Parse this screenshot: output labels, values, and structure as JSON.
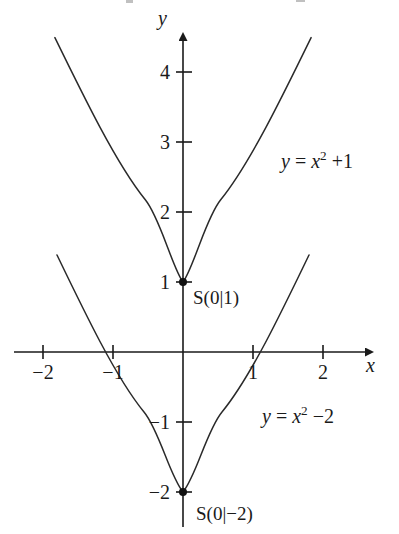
{
  "figure": {
    "type": "coordinate-plane",
    "background_color": "#ffffff",
    "stroke_color": "#1a1a1a",
    "width": 399,
    "height": 534
  },
  "axes": {
    "x_axis_name": "x",
    "y_axis_name": "y",
    "origin_px": [
      183,
      352
    ],
    "pixels_per_unit": 70,
    "x_ticks": [
      {
        "value": -2,
        "label": "−2",
        "px": 43
      },
      {
        "value": -1,
        "label": "−1",
        "px": 113
      },
      {
        "value": 1,
        "label": "1",
        "px": 253
      },
      {
        "value": 2,
        "label": "2",
        "px": 323
      }
    ],
    "y_ticks": [
      {
        "value": 4,
        "label": "4",
        "px": 72
      },
      {
        "value": 3,
        "label": "3",
        "px": 142
      },
      {
        "value": 2,
        "label": "2",
        "px": 212
      },
      {
        "value": 1,
        "label": "1",
        "px": 282
      },
      {
        "value": -1,
        "label": "−1",
        "px": 422
      },
      {
        "value": -2,
        "label": "−2",
        "px": 492
      }
    ]
  },
  "curves": [
    {
      "id": "parabola-upper",
      "label_html": "y = x<sup>2</sup> +1",
      "label_plain": "y = x² + 1",
      "a": 1,
      "c": 1,
      "x_from": -1.83,
      "x_to": 1.83,
      "vertex": {
        "x": 0,
        "y": 1
      },
      "vertex_label": "S(0|1)"
    },
    {
      "id": "parabola-lower",
      "label_html": "y = x<sup>2</sup> −2",
      "label_plain": "y = x² − 2",
      "a": 1,
      "c": -2,
      "x_from": -1.8,
      "x_to": 1.8,
      "vertex": {
        "x": 0,
        "y": -2
      },
      "vertex_label": "S(0|−2)",
      "roots": [
        -1.414,
        1.414
      ]
    }
  ],
  "labels": {
    "equation_upper_px": [
      281,
      151
    ],
    "equation_lower_px": [
      262,
      406
    ],
    "vertex_upper_px": [
      193,
      280
    ],
    "vertex_lower_px": [
      196,
      500
    ],
    "x_name_px": [
      369,
      363
    ],
    "y_name_px": [
      160,
      18
    ]
  },
  "chart_data": {
    "type": "line",
    "title": "",
    "subtitle": "",
    "xlabel": "x",
    "ylabel": "y",
    "xlim": [
      -2.4,
      2.75
    ],
    "ylim": [
      -2.6,
      4.8
    ],
    "xticks": [
      -2,
      -1,
      1,
      2
    ],
    "yticks": [
      4,
      3,
      2,
      1,
      -1,
      -2
    ],
    "grid": false,
    "legend_position": "inline-annotation",
    "series": [
      {
        "name": "y = x² + 1",
        "equation": "y = x^2 + 1",
        "vertex": [
          0,
          1
        ],
        "vertex_label": "S(0|1)",
        "x": [
          -1.83,
          -1.6,
          -1.4,
          -1.2,
          -1.0,
          -0.8,
          -0.6,
          -0.4,
          -0.2,
          0,
          0.2,
          0.4,
          0.6,
          0.8,
          1.0,
          1.2,
          1.4,
          1.6,
          1.83
        ],
        "values": [
          4.35,
          3.56,
          2.96,
          2.44,
          2.0,
          1.64,
          1.36,
          1.16,
          1.04,
          1.0,
          1.04,
          1.16,
          1.36,
          1.64,
          2.0,
          2.44,
          2.96,
          3.56,
          4.35
        ]
      },
      {
        "name": "y = x² − 2",
        "equation": "y = x^2 - 2",
        "vertex": [
          0,
          -2
        ],
        "vertex_label": "S(0|−2)",
        "roots": [
          -1.414,
          1.414
        ],
        "x": [
          -1.8,
          -1.6,
          -1.4,
          -1.2,
          -1.0,
          -0.8,
          -0.6,
          -0.4,
          -0.2,
          0,
          0.2,
          0.4,
          0.6,
          0.8,
          1.0,
          1.2,
          1.4,
          1.6,
          1.8
        ],
        "values": [
          1.24,
          0.56,
          -0.04,
          -0.56,
          -1.0,
          -1.36,
          -1.64,
          -1.84,
          -1.96,
          -2.0,
          -1.96,
          -1.84,
          -1.64,
          -1.36,
          -1.0,
          -0.56,
          -0.04,
          0.56,
          1.24
        ]
      }
    ]
  }
}
